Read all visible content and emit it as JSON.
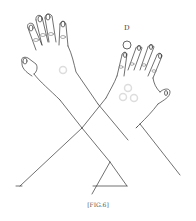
{
  "figure": {
    "caption": "[FIG.6]",
    "label": "D",
    "colors": {
      "line": "#333333",
      "marker": "#cccccc",
      "marker_dark": "#888888"
    }
  }
}
